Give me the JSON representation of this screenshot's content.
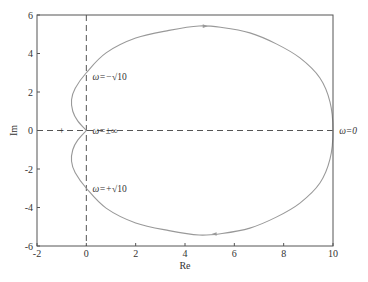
{
  "chart_data": {
    "type": "line",
    "title": "",
    "xlabel": "Re",
    "ylabel": "Im",
    "xlim": [
      -2,
      10
    ],
    "ylim": [
      -6,
      6
    ],
    "xticks": [
      -2,
      0,
      2,
      4,
      6,
      8,
      10
    ],
    "yticks": [
      -6,
      -4,
      -2,
      0,
      2,
      4,
      6
    ],
    "xtick_labels": [
      "-2",
      "0",
      "2",
      "4",
      "6",
      "8",
      "10"
    ],
    "ytick_labels": [
      "-6",
      "-4",
      "-2",
      "0",
      "2",
      "4",
      "6"
    ],
    "grid": false,
    "colors": {
      "curve": "#999999",
      "axes": "#555555",
      "dashed": "#555555"
    },
    "series": [
      {
        "name": "Nyquist curve",
        "points": [
          [
            0,
            0
          ],
          [
            -0.35,
            0.5
          ],
          [
            -0.55,
            1.0
          ],
          [
            -0.6,
            1.6
          ],
          [
            -0.45,
            2.2
          ],
          [
            0,
            3.0
          ],
          [
            0.8,
            4.03
          ],
          [
            2.0,
            4.8
          ],
          [
            3.35,
            5.2
          ],
          [
            4.57,
            5.43
          ],
          [
            5.5,
            5.35
          ],
          [
            6.63,
            5.07
          ],
          [
            7.7,
            4.5
          ],
          [
            8.66,
            3.77
          ],
          [
            9.47,
            2.73
          ],
          [
            9.88,
            1.48
          ],
          [
            10,
            0
          ],
          [
            9.88,
            -1.48
          ],
          [
            9.47,
            -2.73
          ],
          [
            8.66,
            -3.77
          ],
          [
            7.7,
            -4.5
          ],
          [
            6.63,
            -5.07
          ],
          [
            5.5,
            -5.35
          ],
          [
            4.57,
            -5.43
          ],
          [
            3.35,
            -5.2
          ],
          [
            2.0,
            -4.8
          ],
          [
            0.8,
            -4.03
          ],
          [
            0,
            -3.0
          ],
          [
            -0.45,
            -2.2
          ],
          [
            -0.6,
            -1.6
          ],
          [
            -0.55,
            -1.0
          ],
          [
            -0.35,
            -0.5
          ],
          [
            0,
            0
          ]
        ],
        "arrows": [
          {
            "at": [
              4.8,
              5.42
            ],
            "direction": "right"
          },
          {
            "at": [
              5.2,
              -5.38
            ],
            "direction": "left"
          }
        ]
      }
    ],
    "reference_lines": [
      {
        "orientation": "vertical",
        "value": 0,
        "style": "dashed"
      },
      {
        "orientation": "horizontal",
        "value": 0,
        "style": "dashed"
      }
    ],
    "markers": [
      {
        "label": "critical-point",
        "symbol": "+",
        "x": -1,
        "y": 0
      }
    ],
    "annotations": [
      {
        "id": "omega-neg-sqrt10",
        "text_prefix": "ω=−",
        "text_root": "√10",
        "x": 0.25,
        "y": 2.8
      },
      {
        "id": "omega-pm-inf",
        "text": "ω=±∞",
        "x": 0.25,
        "y": 0
      },
      {
        "id": "omega-pos-sqrt10",
        "text_prefix": "ω=+",
        "text_root": "√10",
        "x": 0.25,
        "y": -3.0
      },
      {
        "id": "omega-zero",
        "text": "ω=0",
        "x": 10.25,
        "y": 0
      }
    ]
  }
}
